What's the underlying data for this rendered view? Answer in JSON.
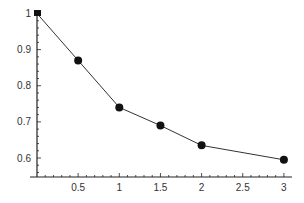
{
  "chart_data": {
    "type": "line",
    "title": "",
    "xlabel": "",
    "ylabel": "",
    "x": [
      0,
      0.5,
      1,
      1.5,
      2,
      3
    ],
    "series": [
      {
        "name": "",
        "values": [
          1.0,
          0.87,
          0.74,
          0.69,
          0.635,
          0.595
        ]
      }
    ],
    "xlim": [
      0,
      3.1
    ],
    "ylim": [
      0.55,
      1.0
    ],
    "x_ticks": [
      0.5,
      1,
      1.5,
      2,
      2.5,
      3
    ],
    "x_tick_labels": [
      "0.5",
      "1",
      "1.5",
      "2",
      "2.5",
      "3"
    ],
    "y_ticks": [
      0.6,
      0.7,
      0.8,
      0.9,
      1
    ],
    "y_tick_labels": [
      "0.6",
      "0.7",
      "0.8",
      "0.9",
      "1"
    ],
    "grid": false,
    "legend": "none",
    "marker": "filled-circle",
    "line_color": "#333333",
    "marker_color": "#111111"
  }
}
